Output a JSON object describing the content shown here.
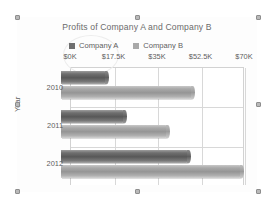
{
  "chart_object": {
    "selected": true,
    "handle_name": "selection-handle"
  },
  "chart_data": {
    "type": "bar",
    "orientation": "horizontal",
    "title": "Profits of Company A and Company B",
    "xlabel": "",
    "ylabel": "Year",
    "categories": [
      "2010",
      "2011",
      "2012"
    ],
    "tick_labels": [
      "$0K",
      "$17.5K",
      "$35K",
      "$52.5K",
      "$70K"
    ],
    "tick_values": [
      0,
      17.5,
      35,
      52.5,
      70
    ],
    "xlim": [
      0,
      70
    ],
    "grid": true,
    "legend_position": "top",
    "series": [
      {
        "name": "Company A",
        "color": "#6f6f6f",
        "values": [
          15,
          22,
          48
        ]
      },
      {
        "name": "Company B",
        "color": "#a9a9a9",
        "values": [
          49.5,
          39.5,
          69
        ]
      }
    ]
  }
}
